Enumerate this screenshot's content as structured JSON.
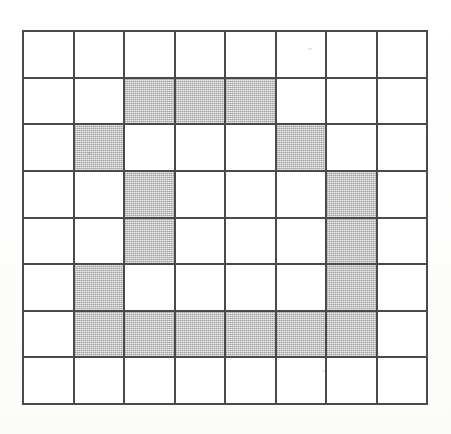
{
  "figure": {
    "title": "",
    "caption": "",
    "background_color": "#fdfdfd",
    "grid_line_color": "#4a4a4a",
    "shaded_cell_color": "#c3c3c3",
    "empty_cell_color": "#ffffff"
  },
  "chart_data": {
    "type": "heatmap",
    "title": "",
    "subtitle": "",
    "xlabel": "",
    "ylabel": "",
    "rows": 8,
    "columns": 8,
    "grid": true,
    "legend": "none",
    "value_labels": {
      "0": "empty",
      "1": "shaded"
    },
    "categories": [
      "1",
      "2",
      "3",
      "4",
      "5",
      "6",
      "7",
      "8"
    ],
    "row_labels": [
      "1",
      "2",
      "3",
      "4",
      "5",
      "6",
      "7",
      "8"
    ],
    "values": [
      [
        0,
        0,
        0,
        0,
        0,
        0,
        0,
        0
      ],
      [
        0,
        0,
        1,
        1,
        1,
        0,
        0,
        0
      ],
      [
        0,
        1,
        0,
        0,
        0,
        1,
        0,
        0
      ],
      [
        0,
        0,
        1,
        0,
        0,
        0,
        1,
        0
      ],
      [
        0,
        0,
        1,
        0,
        0,
        0,
        1,
        0
      ],
      [
        0,
        1,
        0,
        0,
        0,
        0,
        1,
        0
      ],
      [
        0,
        1,
        1,
        1,
        1,
        1,
        1,
        0
      ],
      [
        0,
        0,
        0,
        0,
        0,
        0,
        0,
        0
      ]
    ],
    "shaded_cells": [
      {
        "row": 2,
        "col": 3
      },
      {
        "row": 2,
        "col": 4
      },
      {
        "row": 2,
        "col": 5
      },
      {
        "row": 3,
        "col": 2
      },
      {
        "row": 3,
        "col": 6
      },
      {
        "row": 4,
        "col": 3
      },
      {
        "row": 4,
        "col": 7
      },
      {
        "row": 5,
        "col": 3
      },
      {
        "row": 5,
        "col": 7
      },
      {
        "row": 6,
        "col": 2
      },
      {
        "row": 6,
        "col": 7
      },
      {
        "row": 7,
        "col": 2
      },
      {
        "row": 7,
        "col": 3
      },
      {
        "row": 7,
        "col": 4
      },
      {
        "row": 7,
        "col": 5
      },
      {
        "row": 7,
        "col": 6
      },
      {
        "row": 7,
        "col": 7
      }
    ],
    "shaded_count": 17,
    "empty_count": 47,
    "total_cells": 64
  }
}
